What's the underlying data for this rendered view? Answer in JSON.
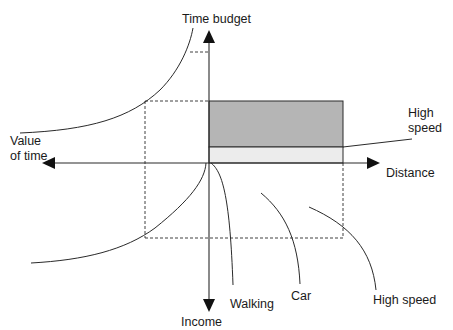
{
  "diagram": {
    "type": "four-quadrant economic diagram",
    "axes": {
      "up": "Time budget",
      "left_line1": "Value",
      "left_line2": "of time",
      "right": "Distance",
      "down": "Income"
    },
    "curve_labels": {
      "high_speed_band_line1": "High",
      "high_speed_band_line2": "speed",
      "walking": "Walking",
      "car": "Car",
      "high_speed": "High speed"
    },
    "colors": {
      "line": "#2a2a2a",
      "dark_fill": "#b5b5b5",
      "light_fill": "#ececec",
      "background": "#ffffff"
    }
  }
}
